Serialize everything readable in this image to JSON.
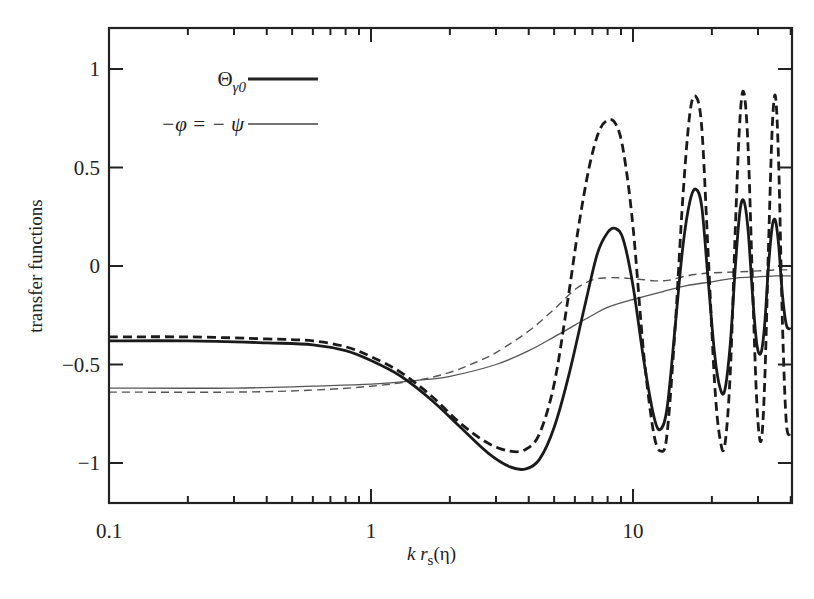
{
  "chart_data": {
    "type": "line",
    "title": "",
    "xlabel": "k r_s(η)",
    "xlabel_parts": {
      "k": "k",
      "r": "r",
      "sub": "s",
      "arg": "(η)"
    },
    "ylabel": "transfer functions",
    "xscale": "log",
    "xlim": [
      0.1,
      40
    ],
    "ylim": [
      -1.2,
      1.2
    ],
    "x_ticks": [
      0.1,
      1,
      10
    ],
    "x_tick_labels": [
      "0.1",
      "1",
      "10"
    ],
    "y_ticks": [
      -1,
      -0.5,
      0,
      0.5,
      1
    ],
    "y_tick_labels": [
      "−1",
      "−0.5",
      "0",
      "0.5",
      "1"
    ],
    "grid": false,
    "legend_position": "upper-left",
    "legend": [
      {
        "label": "Θγ0",
        "label_main": "Θ",
        "label_sub": "γ0",
        "style": "thick-solid"
      },
      {
        "label": "−φ = − ψ",
        "style": "thin-solid"
      }
    ],
    "series": [
      {
        "name": "Θγ0 (solid, thick)",
        "style": "thick-solid",
        "x": [
          0.1,
          0.2,
          0.4,
          0.6,
          0.8,
          1.0,
          1.3,
          1.7,
          2.2,
          2.8,
          3.4,
          3.9,
          4.4,
          5.0,
          5.7,
          6.5,
          7.3,
          8.0,
          8.6,
          9.2,
          10.0,
          11.0,
          12.0,
          12.7,
          13.5,
          14.5,
          15.5,
          16.5,
          17.4,
          18.3,
          19.3,
          20.5,
          21.5,
          22.4,
          23.5,
          24.6,
          25.6,
          26.5,
          27.5,
          28.6,
          29.7,
          30.8,
          31.8,
          32.9,
          34.0,
          35.0,
          36.0,
          37.2,
          38.5,
          40.0
        ],
        "y": [
          -0.38,
          -0.38,
          -0.39,
          -0.4,
          -0.43,
          -0.48,
          -0.56,
          -0.68,
          -0.82,
          -0.95,
          -1.02,
          -1.03,
          -0.98,
          -0.82,
          -0.55,
          -0.22,
          0.06,
          0.17,
          0.19,
          0.13,
          -0.1,
          -0.48,
          -0.76,
          -0.83,
          -0.72,
          -0.3,
          0.1,
          0.33,
          0.39,
          0.3,
          -0.05,
          -0.45,
          -0.62,
          -0.63,
          -0.4,
          0.0,
          0.28,
          0.33,
          0.18,
          -0.15,
          -0.4,
          -0.44,
          -0.3,
          0.0,
          0.2,
          0.23,
          0.1,
          -0.15,
          -0.3,
          -0.32
        ]
      },
      {
        "name": "Θγ0 + ψ (dashed, thick)",
        "style": "thick-dashed",
        "x": [
          0.1,
          0.2,
          0.4,
          0.6,
          0.8,
          1.0,
          1.3,
          1.7,
          2.2,
          2.8,
          3.4,
          3.9,
          4.4,
          5.0,
          5.6,
          6.2,
          6.8,
          7.4,
          8.0,
          8.6,
          9.2,
          10.0,
          11.0,
          12.0,
          12.8,
          13.5,
          14.5,
          15.5,
          16.5,
          17.4,
          18.3,
          19.3,
          20.5,
          21.5,
          22.4,
          23.5,
          24.6,
          25.6,
          26.5,
          27.5,
          28.6,
          29.7,
          30.8,
          31.8,
          32.9,
          34.0,
          35.0,
          36.0,
          37.2,
          38.5,
          40.0
        ],
        "y": [
          -0.36,
          -0.36,
          -0.37,
          -0.38,
          -0.41,
          -0.46,
          -0.54,
          -0.66,
          -0.8,
          -0.9,
          -0.94,
          -0.93,
          -0.85,
          -0.6,
          -0.2,
          0.2,
          0.5,
          0.68,
          0.74,
          0.72,
          0.58,
          0.2,
          -0.45,
          -0.85,
          -0.94,
          -0.85,
          -0.3,
          0.35,
          0.78,
          0.86,
          0.7,
          0.1,
          -0.6,
          -0.88,
          -0.91,
          -0.55,
          0.2,
          0.75,
          0.88,
          0.6,
          -0.1,
          -0.7,
          -0.89,
          -0.6,
          0.1,
          0.7,
          0.86,
          0.5,
          -0.3,
          -0.8,
          -0.85
        ]
      },
      {
        "name": "−φ = −ψ (thin, solid)",
        "style": "thin-solid",
        "x": [
          0.1,
          0.3,
          0.6,
          1.0,
          1.5,
          2.0,
          3.0,
          4.0,
          5.0,
          6.0,
          7.0,
          8.0,
          10.0,
          13.0,
          16.0,
          20.0,
          25.0,
          30.0,
          35.0,
          40.0
        ],
        "y": [
          -0.62,
          -0.62,
          -0.61,
          -0.6,
          -0.58,
          -0.56,
          -0.5,
          -0.43,
          -0.36,
          -0.3,
          -0.25,
          -0.21,
          -0.17,
          -0.13,
          -0.1,
          -0.08,
          -0.06,
          -0.055,
          -0.05,
          -0.05
        ]
      },
      {
        "name": "thin dashed",
        "style": "thin-dashed",
        "x": [
          0.1,
          0.3,
          0.6,
          1.0,
          1.5,
          2.0,
          2.5,
          3.0,
          4.0,
          5.0,
          6.0,
          7.0,
          8.0,
          9.0,
          10.0,
          11.0,
          12.0,
          13.0,
          14.0,
          16.0,
          18.0,
          20.0,
          25.0,
          30.0,
          35.0,
          40.0
        ],
        "y": [
          -0.64,
          -0.64,
          -0.63,
          -0.61,
          -0.58,
          -0.54,
          -0.49,
          -0.44,
          -0.33,
          -0.22,
          -0.12,
          -0.07,
          -0.06,
          -0.06,
          -0.065,
          -0.07,
          -0.075,
          -0.075,
          -0.07,
          -0.05,
          -0.04,
          -0.035,
          -0.03,
          -0.025,
          -0.02,
          -0.02
        ]
      }
    ]
  },
  "plot_frame": {
    "left": 109,
    "top": 28,
    "right": 792,
    "bottom": 503,
    "y_at_1": 69,
    "px_per_unit_y": 197,
    "x_at_0.1": 109,
    "px_per_decade": 262
  }
}
